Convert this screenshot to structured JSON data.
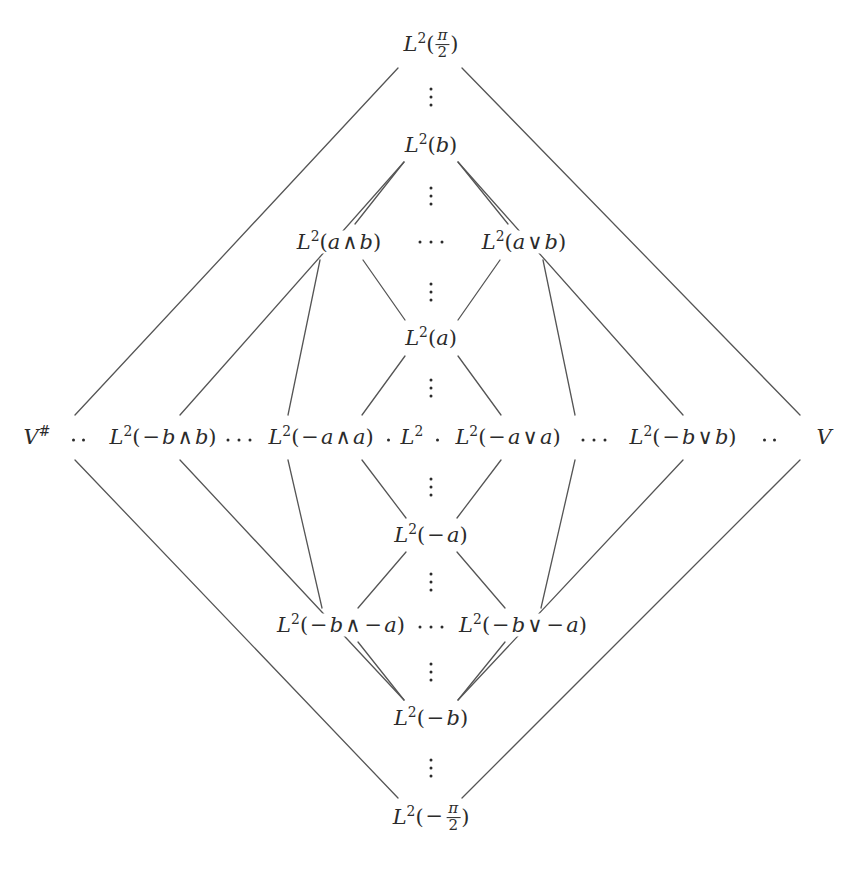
{
  "figure": {
    "type": "hasse-lattice-diagram",
    "title": "",
    "background_color": "#ffffff",
    "line_color": "#555555",
    "text_color": "#2b2b2b",
    "width": 861,
    "height": 882
  },
  "nodes": {
    "top": "L2(pi/2)",
    "b": "L2(b)",
    "a_and_b": "L2(a ^ b)",
    "a_or_b": "L2(a v b)",
    "a": "L2(a)",
    "v_sharp": "V#",
    "nb_and_b": "L2(-b ^ b)",
    "na_and_a": "L2(-a ^ a)",
    "center": "L2",
    "na_or_a": "L2(-a v a)",
    "nb_or_b": "L2(-b v b)",
    "v": "V",
    "neg_a": "L2(-a)",
    "nb_and_na": "L2(-b ^ -a)",
    "nb_or_na": "L2(-b v -a)",
    "neg_b": "L2(-b)",
    "bottom": "L2(-pi/2)"
  },
  "labels": {
    "L": "L",
    "two": "2",
    "lparen": "(",
    "rparen": ")",
    "pi": "π",
    "denom_two": "2",
    "minus": "−",
    "meet": "∧",
    "join": "∨",
    "a": "a",
    "b": "b",
    "V": "V",
    "sharp": "#"
  },
  "rows": [
    {
      "y": 45,
      "name": "row-top",
      "items": [
        "L2(pi/2)"
      ]
    },
    {
      "y": 145,
      "name": "row-b",
      "items": [
        "L2(b)"
      ]
    },
    {
      "y": 242,
      "name": "row-ab",
      "items": [
        "L2(a ^ b)",
        "L2(a v b)"
      ]
    },
    {
      "y": 338,
      "name": "row-a",
      "items": [
        "L2(a)"
      ]
    },
    {
      "y": 437,
      "name": "row-middle",
      "items": [
        "V#",
        "L2(-b ^ b)",
        "L2(-a ^ a)",
        "L2",
        "L2(-a v a)",
        "L2(-b v b)",
        "V"
      ]
    },
    {
      "y": 535,
      "name": "row-neg-a",
      "items": [
        "L2(-a)"
      ]
    },
    {
      "y": 625,
      "name": "row-neg-ab",
      "items": [
        "L2(-b ^ -a)",
        "L2(-b v -a)"
      ]
    },
    {
      "y": 718,
      "name": "row-neg-b",
      "items": [
        "L2(-b)"
      ]
    },
    {
      "y": 818,
      "name": "row-bottom",
      "items": [
        "L2(-pi/2)"
      ]
    }
  ],
  "ellipses": {
    "vertical_between_levels": 8,
    "horizontal_in_rows": 7,
    "dot_glyph": "·"
  }
}
